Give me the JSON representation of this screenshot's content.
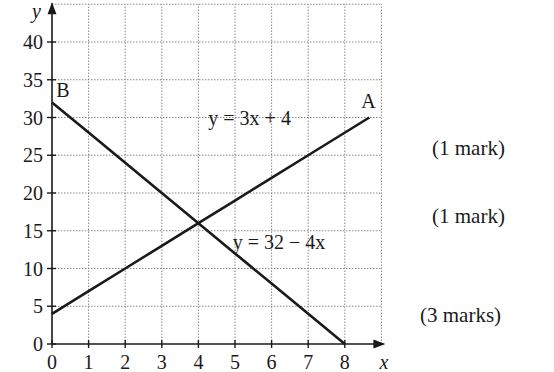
{
  "chart_data": {
    "type": "line",
    "title": "",
    "xlabel": "x",
    "ylabel": "y",
    "xlim": [
      0,
      9
    ],
    "ylim": [
      0,
      45
    ],
    "grid": true,
    "x_ticks": [
      0,
      1,
      2,
      3,
      4,
      5,
      6,
      7,
      8
    ],
    "y_ticks": [
      0,
      5,
      10,
      15,
      20,
      25,
      30,
      35,
      40
    ],
    "series": [
      {
        "name": "y = 3x + 4",
        "point_label": "A",
        "x": [
          0,
          1,
          2,
          3,
          4,
          5,
          6,
          7,
          8.67
        ],
        "y": [
          4,
          7,
          10,
          13,
          16,
          19,
          22,
          25,
          30
        ],
        "end_point": {
          "x": 8.67,
          "y": 30
        },
        "label": {
          "text": "y = 3x + 4",
          "x": 5.4,
          "y": 30
        }
      },
      {
        "name": "y = 32 − 4x",
        "point_label": "B",
        "x": [
          0,
          1,
          2,
          3,
          4,
          5,
          6,
          7,
          8
        ],
        "y": [
          32,
          28,
          24,
          20,
          16,
          12,
          8,
          4,
          0
        ],
        "start_point": {
          "x": 0,
          "y": 32
        },
        "label": {
          "text": "y = 32 − 4x",
          "x": 6.2,
          "y": 13.5
        }
      }
    ],
    "annotations": [
      {
        "text": "A",
        "x": 8.65,
        "y": 32.2
      },
      {
        "text": "B",
        "x": 0.3,
        "y": 33.7
      },
      {
        "text": "intersection",
        "x": 4,
        "y": 16
      }
    ]
  },
  "marks": [
    {
      "text": "(1 mark)",
      "top": 136
    },
    {
      "text": "(1 mark)",
      "top": 204
    },
    {
      "text": "(3 marks)",
      "top": 303
    }
  ]
}
